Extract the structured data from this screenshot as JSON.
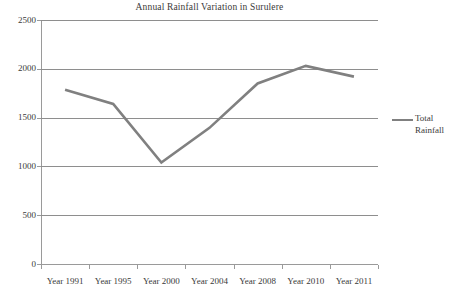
{
  "chart_data": {
    "type": "line",
    "title": "Annual Rainfall Variation in Surulere",
    "xlabel": "",
    "ylabel": "",
    "categories": [
      "Year 1991",
      "Year 1995",
      "Year 2000",
      "Year 2004",
      "Year 2008",
      "Year 2010",
      "Year 2011"
    ],
    "series": [
      {
        "name": "Total Rainfall",
        "values": [
          1785,
          1640,
          1040,
          1395,
          1850,
          2030,
          1920
        ]
      }
    ],
    "ylim": [
      0,
      2500
    ],
    "yticks": [
      0,
      500,
      1000,
      1500,
      2000,
      2500
    ],
    "ytick_labels": [
      "0",
      "500",
      "1000",
      "1500",
      "2000",
      "2500"
    ],
    "grid": true,
    "legend_position": "right",
    "series_color": "#808080",
    "grid_color": "#8e8e8e",
    "axis_color": "#9a9a9a",
    "text_color": "#3a3a3a"
  },
  "legend": {
    "entries": [
      {
        "label": "Total Rainfall",
        "color": "#808080"
      }
    ]
  }
}
